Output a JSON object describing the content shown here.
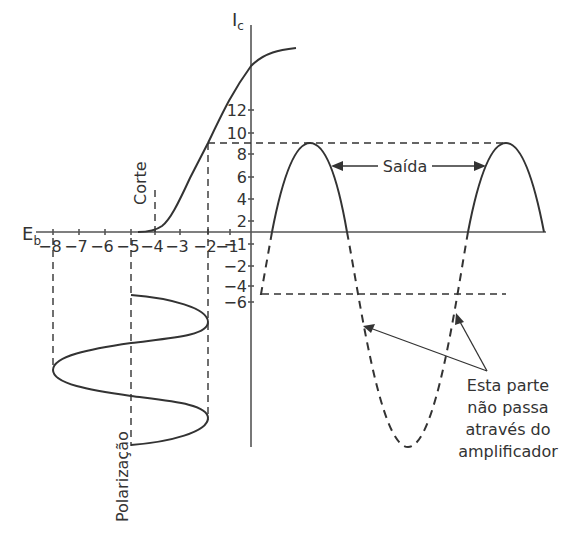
{
  "axes": {
    "x_label_main": "E",
    "x_label_sub": "b",
    "y_label_main": "I",
    "y_label_sub": "c",
    "x_ticks": [
      "-8",
      "-7",
      "-6",
      "-5",
      "-4",
      "-3",
      "-2",
      "-1"
    ],
    "y_ticks_positive": [
      "12",
      "10",
      "8",
      "6",
      "4",
      "2"
    ],
    "y_ticks_negative": [
      "-1",
      "-2",
      "-4",
      "-6"
    ]
  },
  "labels": {
    "cutoff": "Corte",
    "bias": "Polarização",
    "output": "Saída",
    "note_lines": [
      "Esta parte",
      "não passa",
      "através do",
      "amplificador"
    ]
  },
  "values": {
    "cutoff_voltage": -4,
    "bias_voltage": -5,
    "input_swing_min": -8,
    "input_swing_max": -2,
    "output_peak": 9,
    "output_negative_level": -5
  },
  "colors": {
    "ink": "#333333",
    "axis": "#555555",
    "background": "#ffffff"
  }
}
